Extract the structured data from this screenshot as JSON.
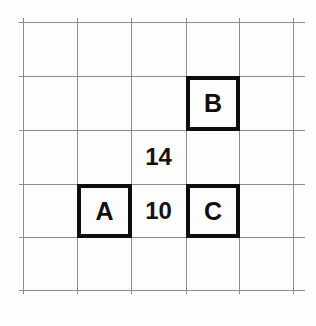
{
  "figure": {
    "background_color": "#fdfdfc",
    "gridline_color": "#8a8a8a",
    "box_border_color": "#0d0d0d",
    "text_color": "#0d0d0d",
    "width": 316,
    "height": 326
  },
  "grid": {
    "columns": 5,
    "rows": 5,
    "cell_size": 54,
    "origin_x": 23,
    "origin_y": 22,
    "vertical_line_x": [
      23,
      77,
      131,
      186,
      239,
      293
    ],
    "horizontal_line_y": [
      22,
      76,
      130,
      184,
      237,
      290
    ]
  },
  "boxes": [
    {
      "label": "A",
      "column": 2,
      "row": 4,
      "x": 77,
      "y": 184,
      "width": 55,
      "height": 54
    },
    {
      "label": "B",
      "column": 4,
      "row": 2,
      "x": 186,
      "y": 76,
      "width": 54,
      "height": 55
    },
    {
      "label": "C",
      "column": 4,
      "row": 4,
      "x": 186,
      "y": 184,
      "width": 54,
      "height": 54
    }
  ],
  "labels": [
    {
      "text": "14",
      "column": 3,
      "row": 3,
      "x": 131,
      "y": 130,
      "width": 55,
      "height": 54
    },
    {
      "text": "10",
      "column": 3,
      "row": 4,
      "x": 131,
      "y": 184,
      "width": 55,
      "height": 54
    }
  ]
}
